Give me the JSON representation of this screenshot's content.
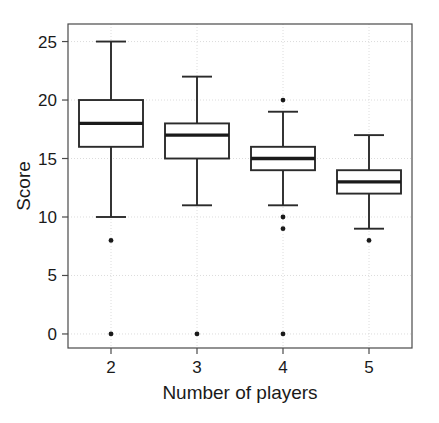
{
  "chart_data": {
    "type": "box",
    "title": "",
    "xlabel": "Number of players",
    "ylabel": "Score",
    "categories": [
      "2",
      "3",
      "4",
      "5"
    ],
    "xlim": [
      1.5,
      5.5
    ],
    "ylim": [
      -1.2,
      26.5
    ],
    "yticks": [
      0,
      5,
      10,
      15,
      20,
      25
    ],
    "ytick_labels": [
      "0",
      "5",
      "10",
      "15",
      "20",
      "25"
    ],
    "xticks": [
      2,
      3,
      4,
      5
    ],
    "xtick_labels": [
      "2",
      "3",
      "4",
      "5"
    ],
    "grid": true,
    "legend": "none",
    "boxes": [
      {
        "category": "2",
        "x": 2,
        "whisker_low": 10,
        "q1": 16,
        "median": 18,
        "q3": 20,
        "whisker_high": 25,
        "outliers": [
          8,
          0
        ]
      },
      {
        "category": "3",
        "x": 3,
        "whisker_low": 11,
        "q1": 15,
        "median": 17,
        "q3": 18,
        "whisker_high": 22,
        "outliers": [
          0
        ]
      },
      {
        "category": "4",
        "x": 4,
        "whisker_low": 11,
        "q1": 14,
        "median": 15,
        "q3": 16,
        "whisker_high": 19,
        "outliers": [
          20,
          10,
          9,
          0
        ]
      },
      {
        "category": "5",
        "x": 5,
        "whisker_low": 9,
        "q1": 12,
        "median": 13,
        "q3": 14,
        "whisker_high": 17,
        "outliers": [
          8
        ]
      }
    ],
    "colors": {
      "box_fill": "#ffffff",
      "box_stroke": "#2b2b2b",
      "median": "#1a1a1a",
      "grid": "#d8d8d8",
      "frame": "#4a4a4a",
      "text": "#1a1a1a",
      "outlier": "#1a1a1a"
    }
  }
}
